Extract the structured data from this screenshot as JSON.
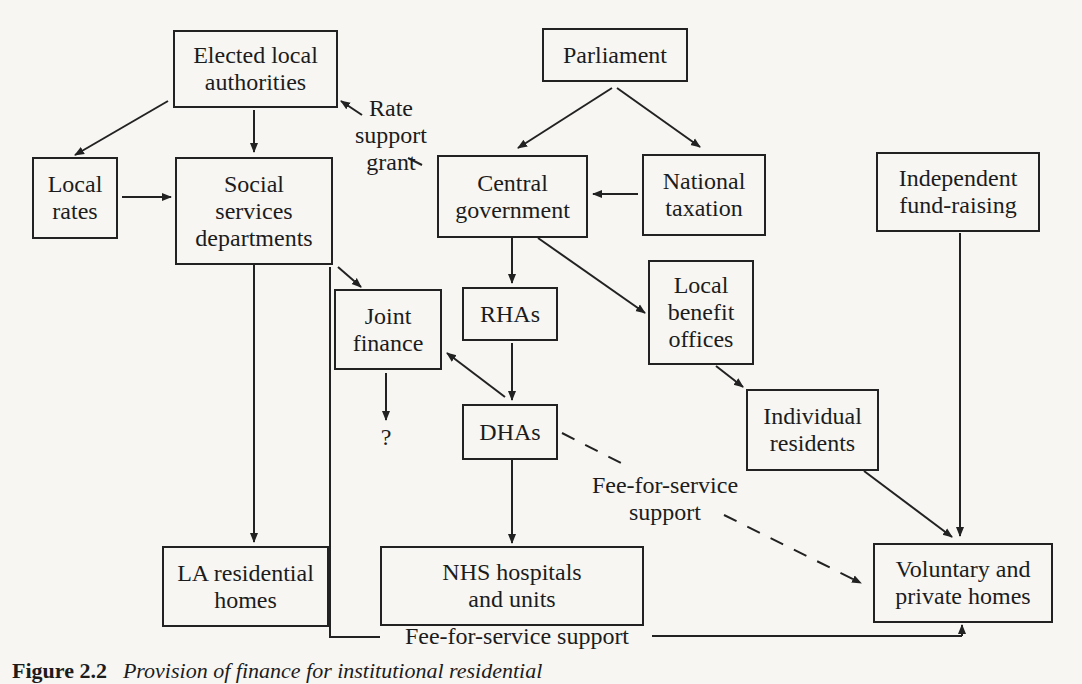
{
  "nodes": {
    "elected_local_authorities": "Elected local\nauthorities",
    "parliament": "Parliament",
    "local_rates": "Local\nrates",
    "social_services": "Social\nservices\ndepartments",
    "central_government": "Central\ngovernment",
    "national_taxation": "National\ntaxation",
    "independent_fund_raising": "Independent\nfund-raising",
    "joint_finance": "Joint\nfinance",
    "rhas": "RHAs",
    "local_benefit_offices": "Local\nbenefit\noffices",
    "dhas": "DHAs",
    "individual_residents": "Individual\nresidents",
    "la_residential_homes": "LA residential\nhomes",
    "nhs_hospitals": "NHS hospitals\nand units",
    "voluntary_private_homes": "Voluntary and\nprivate homes"
  },
  "labels": {
    "rate_support_grant": "Rate\nsupport\ngrant",
    "unknown_outcome": "?",
    "fee_for_service_dashed": "Fee-for-service\nsupport",
    "fee_for_service_bottom": "Fee-for-service support"
  },
  "caption": {
    "number": "Figure 2.2",
    "title": "Provision of finance for institutional residential"
  }
}
